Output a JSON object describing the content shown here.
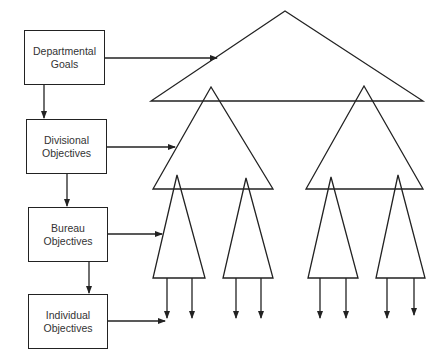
{
  "diagram": {
    "boxes": [
      {
        "line1": "Departmental",
        "line2": "Goals"
      },
      {
        "line1": "Divisional",
        "line2": "Objectives"
      },
      {
        "line1": "Bureau",
        "line2": "Objectives"
      },
      {
        "line1": "Individual",
        "line2": "Objectives"
      }
    ],
    "colors": {
      "stroke": "#222222",
      "text": "#333333",
      "background": "#ffffff"
    }
  }
}
